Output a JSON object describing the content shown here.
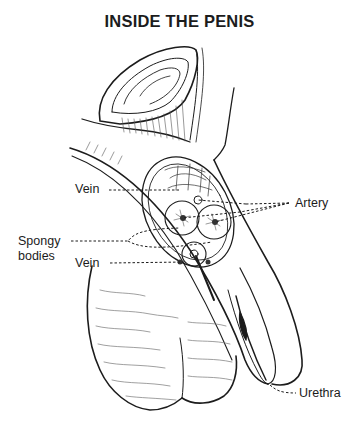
{
  "diagram": {
    "title": "INSIDE THE PENIS",
    "labels": {
      "vein_upper": "Vein",
      "artery": "Artery",
      "spongy_bodies_line1": "Spongy",
      "spongy_bodies_line2": "bodies",
      "vein_lower": "Vein",
      "urethra": "Urethra"
    },
    "colors": {
      "ink": "#1c1c1c",
      "shading": "#6e6e6e",
      "background": "#ffffff"
    }
  }
}
